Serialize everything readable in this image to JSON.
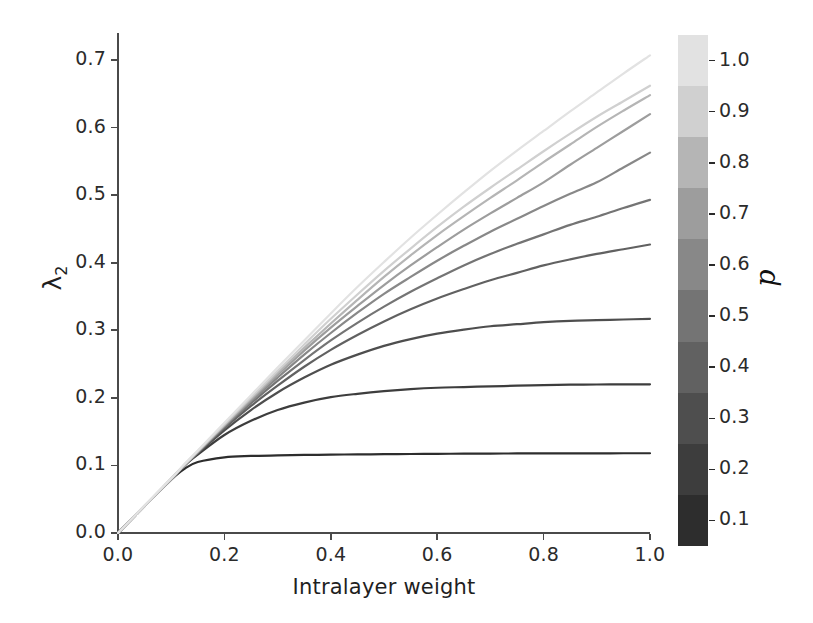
{
  "chart_data": {
    "type": "line",
    "title": "",
    "xlabel": "Intralayer weight",
    "ylabel": "λ₂",
    "ylabel_base": "λ",
    "ylabel_sub": "2",
    "xlim": [
      0.0,
      1.0
    ],
    "ylim": [
      0.0,
      0.74
    ],
    "grid": false,
    "xticks": [
      "0.0",
      "0.2",
      "0.4",
      "0.6",
      "0.8",
      "1.0"
    ],
    "xtick_values": [
      0.0,
      0.2,
      0.4,
      0.6,
      0.8,
      1.0
    ],
    "yticks": [
      "0.0",
      "0.1",
      "0.2",
      "0.3",
      "0.4",
      "0.5",
      "0.6",
      "0.7"
    ],
    "ytick_values": [
      0.0,
      0.1,
      0.2,
      0.3,
      0.4,
      0.5,
      0.6,
      0.7
    ],
    "legend_position": "colorbar-right",
    "colorbar": {
      "label": "p",
      "orientation": "vertical",
      "discrete": true,
      "ticks": [
        "0.1",
        "0.2",
        "0.3",
        "0.4",
        "0.5",
        "0.6",
        "0.7",
        "0.8",
        "0.9",
        "1.0"
      ],
      "tick_values": [
        0.1,
        0.2,
        0.3,
        0.4,
        0.5,
        0.6,
        0.7,
        0.8,
        0.9,
        1.0
      ],
      "bands_bottom_to_top": [
        {
          "value": 0.1,
          "color": "#2d2d2d"
        },
        {
          "value": 0.2,
          "color": "#3d3d3d"
        },
        {
          "value": 0.3,
          "color": "#4e4e4e"
        },
        {
          "value": 0.4,
          "color": "#616161"
        },
        {
          "value": 0.5,
          "color": "#747474"
        },
        {
          "value": 0.6,
          "color": "#888888"
        },
        {
          "value": 0.7,
          "color": "#9d9d9d"
        },
        {
          "value": 0.8,
          "color": "#b5b5b5"
        },
        {
          "value": 0.9,
          "color": "#d0d0d0"
        },
        {
          "value": 1.0,
          "color": "#e2e2e2"
        }
      ]
    },
    "x": [
      0.0,
      0.05,
      0.1,
      0.125,
      0.15,
      0.2,
      0.25,
      0.3,
      0.35,
      0.4,
      0.45,
      0.5,
      0.55,
      0.6,
      0.65,
      0.7,
      0.75,
      0.8,
      0.85,
      0.9,
      0.95,
      1.0
    ],
    "series": [
      {
        "name": "p = 0.1",
        "p": 0.1,
        "color": "#2d2d2d",
        "y_at_x1": 0.118,
        "values": [
          0.0,
          0.04,
          0.079,
          0.095,
          0.105,
          0.112,
          0.114,
          0.115,
          0.1155,
          0.116,
          0.1163,
          0.1166,
          0.1169,
          0.1172,
          0.1174,
          0.1176,
          0.1177,
          0.1178,
          0.1179,
          0.1179,
          0.118,
          0.118
        ]
      },
      {
        "name": "p = 0.2",
        "p": 0.2,
        "color": "#3d3d3d",
        "y_at_x1": 0.22,
        "values": [
          0.0,
          0.04,
          0.08,
          0.1,
          0.116,
          0.145,
          0.166,
          0.182,
          0.193,
          0.201,
          0.206,
          0.21,
          0.213,
          0.215,
          0.216,
          0.217,
          0.218,
          0.219,
          0.2195,
          0.2198,
          0.2199,
          0.22
        ]
      },
      {
        "name": "p = 0.3",
        "p": 0.3,
        "color": "#4e4e4e",
        "y_at_x1": 0.317,
        "values": [
          0.0,
          0.04,
          0.08,
          0.1,
          0.118,
          0.152,
          0.182,
          0.208,
          0.23,
          0.249,
          0.264,
          0.277,
          0.287,
          0.295,
          0.301,
          0.306,
          0.309,
          0.312,
          0.314,
          0.315,
          0.316,
          0.317
        ]
      },
      {
        "name": "p = 0.4",
        "p": 0.4,
        "color": "#616161",
        "y_at_x1": 0.427,
        "values": [
          0.0,
          0.04,
          0.08,
          0.1,
          0.119,
          0.155,
          0.188,
          0.218,
          0.246,
          0.271,
          0.293,
          0.313,
          0.331,
          0.347,
          0.361,
          0.374,
          0.385,
          0.396,
          0.405,
          0.413,
          0.42,
          0.427
        ]
      },
      {
        "name": "p = 0.5",
        "p": 0.5,
        "color": "#747474",
        "y_at_x1": 0.493,
        "values": [
          0.0,
          0.04,
          0.08,
          0.1,
          0.119,
          0.157,
          0.192,
          0.225,
          0.256,
          0.285,
          0.311,
          0.335,
          0.357,
          0.377,
          0.396,
          0.413,
          0.428,
          0.442,
          0.456,
          0.468,
          0.481,
          0.493
        ]
      },
      {
        "name": "p = 0.6",
        "p": 0.6,
        "color": "#888888",
        "y_at_x1": 0.563,
        "values": [
          0.0,
          0.04,
          0.08,
          0.1,
          0.12,
          0.158,
          0.195,
          0.23,
          0.264,
          0.296,
          0.326,
          0.354,
          0.379,
          0.403,
          0.425,
          0.446,
          0.465,
          0.484,
          0.502,
          0.519,
          0.541,
          0.563
        ]
      },
      {
        "name": "p = 0.7",
        "p": 0.7,
        "color": "#9d9d9d",
        "y_at_x1": 0.62,
        "values": [
          0.0,
          0.04,
          0.08,
          0.101,
          0.12,
          0.159,
          0.197,
          0.234,
          0.27,
          0.304,
          0.336,
          0.367,
          0.396,
          0.423,
          0.449,
          0.473,
          0.496,
          0.519,
          0.545,
          0.57,
          0.595,
          0.62
        ]
      },
      {
        "name": "p = 0.8",
        "p": 0.8,
        "color": "#b5b5b5",
        "y_at_x1": 0.648,
        "values": [
          0.0,
          0.04,
          0.08,
          0.101,
          0.121,
          0.16,
          0.199,
          0.237,
          0.274,
          0.31,
          0.345,
          0.379,
          0.411,
          0.441,
          0.469,
          0.496,
          0.522,
          0.549,
          0.575,
          0.601,
          0.625,
          0.648
        ]
      },
      {
        "name": "p = 0.9",
        "p": 0.9,
        "color": "#d0d0d0",
        "y_at_x1": 0.662,
        "values": [
          0.0,
          0.04,
          0.08,
          0.101,
          0.121,
          0.161,
          0.201,
          0.24,
          0.279,
          0.317,
          0.353,
          0.388,
          0.421,
          0.453,
          0.483,
          0.511,
          0.538,
          0.565,
          0.591,
          0.616,
          0.639,
          0.662
        ]
      },
      {
        "name": "p = 1.0",
        "p": 1.0,
        "color": "#e2e2e2",
        "y_at_x1": 0.707,
        "values": [
          0.0,
          0.041,
          0.081,
          0.102,
          0.122,
          0.163,
          0.204,
          0.245,
          0.285,
          0.325,
          0.364,
          0.401,
          0.437,
          0.471,
          0.504,
          0.536,
          0.566,
          0.595,
          0.624,
          0.652,
          0.68,
          0.707
        ]
      }
    ]
  },
  "axis_style": {
    "spine_color": "#4a4a4a",
    "tick_color": "#2b2b2b",
    "background": "#ffffff"
  }
}
